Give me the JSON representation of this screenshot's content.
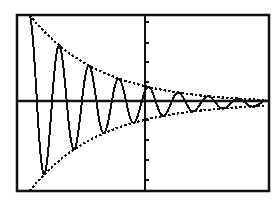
{
  "screen": {
    "background": "#ffffff",
    "ink": "#111111",
    "frame": {
      "x": 17,
      "y": 15,
      "width": 252,
      "height": 176,
      "stroke_width": 2.5
    }
  },
  "chart_data": {
    "type": "line",
    "title": "",
    "xlabel": "",
    "ylabel": "",
    "grid": false,
    "legend": null,
    "axes": {
      "x_axis_pixel_y": 101,
      "y_axis_pixel_x": 145,
      "y_ticks_pixel": [
        22,
        43,
        62,
        82,
        120,
        140,
        160,
        180
      ]
    },
    "window": {
      "xmin": -4,
      "xmax": 4,
      "ymin": -4,
      "ymax": 4
    },
    "pixel_map": {
      "x0": 17,
      "x1": 268,
      "y0": 191,
      "y1": 15
    },
    "series": [
      {
        "name": "upper-envelope",
        "style": "dotted",
        "formula": "y = 4*e^(-0.45*(x+3.6))",
        "points": [
          [
            -3.6,
            3.6
          ],
          [
            -3.0,
            2.75
          ],
          [
            -2.5,
            2.2
          ],
          [
            -2.0,
            1.76
          ],
          [
            -1.5,
            1.4
          ],
          [
            -1.0,
            1.12
          ],
          [
            -0.5,
            0.9
          ],
          [
            0.0,
            0.72
          ],
          [
            0.5,
            0.57
          ],
          [
            1.0,
            0.46
          ],
          [
            1.5,
            0.37
          ],
          [
            2.0,
            0.29
          ],
          [
            2.5,
            0.23
          ],
          [
            3.0,
            0.19
          ],
          [
            3.5,
            0.15
          ],
          [
            3.9,
            0.12
          ]
        ]
      },
      {
        "name": "lower-envelope",
        "style": "dotted",
        "formula": "y = -4*e^(-0.45*(x+3.6))",
        "points": [
          [
            -3.6,
            -3.6
          ],
          [
            -3.0,
            -2.75
          ],
          [
            -2.5,
            -2.2
          ],
          [
            -2.0,
            -1.76
          ],
          [
            -1.5,
            -1.4
          ],
          [
            -1.0,
            -1.12
          ],
          [
            -0.5,
            -0.9
          ],
          [
            0.0,
            -0.72
          ],
          [
            0.5,
            -0.57
          ],
          [
            1.0,
            -0.46
          ],
          [
            1.5,
            -0.37
          ],
          [
            2.0,
            -0.29
          ],
          [
            2.5,
            -0.23
          ],
          [
            3.0,
            -0.19
          ],
          [
            3.5,
            -0.15
          ],
          [
            3.9,
            -0.12
          ]
        ]
      },
      {
        "name": "damped-oscillation",
        "style": "solid",
        "formula": "y = 4*e^(-0.45*(x+3.6))*cos(2*pi*(x+3.6)/0.95)",
        "x_start": -3.6,
        "x_end": 3.95,
        "decay": 0.45,
        "amplitude": 4,
        "period": 0.95,
        "samples": 600
      }
    ]
  }
}
